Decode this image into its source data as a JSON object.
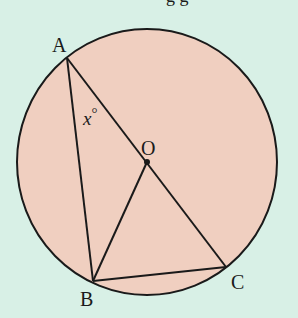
{
  "diagram": {
    "type": "circle-geometry",
    "background_color": "#d8f0e6",
    "circle": {
      "fill": "#f0cfc0",
      "stroke": "#1a1a1a",
      "center": "O"
    },
    "points": {
      "A": {
        "label": "A"
      },
      "B": {
        "label": "B"
      },
      "C": {
        "label": "C"
      },
      "O": {
        "label": "O"
      }
    },
    "segments": [
      "AB",
      "AC",
      "OB",
      "BC"
    ],
    "angle_label": {
      "at": "A",
      "text": "x",
      "unit": "°"
    },
    "top_text_fragment": "g g"
  }
}
